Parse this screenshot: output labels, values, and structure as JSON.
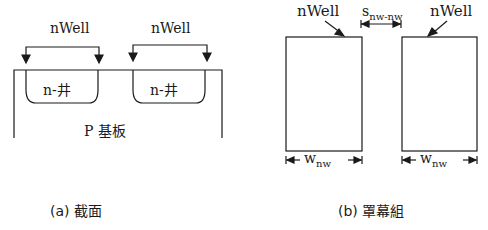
{
  "cross_section": {
    "label_left": "nWell",
    "label_right": "nWell",
    "well_left": "n-井",
    "well_right": "n-井",
    "substrate": "P 基板",
    "caption": "(a) 截面"
  },
  "mask": {
    "label_left": "nWell",
    "label_right": "nWell",
    "spacing_main": "s",
    "spacing_sub": "nw-nw",
    "width_left_main": "w",
    "width_left_sub": "nw",
    "width_right_main": "w",
    "width_right_sub": "nw",
    "caption": "(b) 罩幕組"
  },
  "colors": {
    "stroke": "#1a1a1a",
    "background": "#ffffff"
  }
}
